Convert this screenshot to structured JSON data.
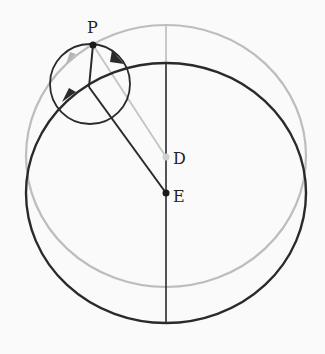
{
  "diagram": {
    "labels": {
      "P": "P",
      "D": "D",
      "E": "E"
    },
    "colors": {
      "primary": "#2a2a2a",
      "secondary": "#bdbdbd",
      "background": "#fafafa"
    },
    "points": {
      "P": {
        "x": 93,
        "y": 45
      },
      "D": {
        "x": 166,
        "y": 157
      },
      "E": {
        "x": 166,
        "y": 193
      },
      "hub": {
        "x": 89,
        "y": 87
      }
    },
    "circles": {
      "large_black": {
        "cx": 166,
        "cy": 193,
        "rx": 140,
        "ry": 130,
        "color": "primary"
      },
      "large_gray": {
        "cx": 166,
        "cy": 156,
        "rx": 140,
        "ry": 131,
        "color": "secondary"
      },
      "small_epicycle": {
        "cx": 90,
        "cy": 84,
        "r": 40,
        "color": "primary"
      }
    }
  }
}
